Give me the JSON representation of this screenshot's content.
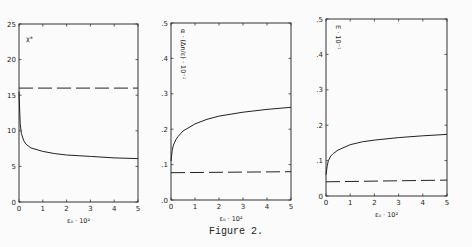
{
  "caption": "Figure 2.",
  "chart_data": [
    {
      "type": "line",
      "title": "",
      "xlabel": "ε₀ · 10²",
      "ylabel": "χ*",
      "xlim": [
        0,
        5
      ],
      "ylim": [
        0,
        25
      ],
      "xticks": [
        "0",
        "1",
        "2",
        "3",
        "4",
        "5"
      ],
      "yticks": [
        "0",
        "5",
        "10",
        "15",
        "20",
        "25"
      ],
      "grid": false,
      "series": [
        {
          "name": "solid",
          "style": "solid",
          "x": [
            0,
            0.05,
            0.1,
            0.2,
            0.3,
            0.5,
            1,
            1.5,
            2,
            3,
            4,
            5
          ],
          "y": [
            15.5,
            11,
            9.6,
            8.6,
            8.1,
            7.6,
            7.1,
            6.8,
            6.6,
            6.4,
            6.2,
            6.1
          ]
        },
        {
          "name": "dashed",
          "style": "dashed",
          "x": [
            0,
            5
          ],
          "y": [
            16,
            16
          ]
        }
      ]
    },
    {
      "type": "line",
      "title": "",
      "xlabel": "ε₀ · 10²",
      "ylabel": "α · (Δn/ε) · 10⁻¹",
      "xlim": [
        0,
        5
      ],
      "ylim": [
        0,
        0.5
      ],
      "xticks": [
        "0",
        "1",
        "2",
        "3",
        "4",
        "5"
      ],
      "yticks": [
        ".0",
        ".1",
        ".2",
        ".3",
        ".4",
        ".5"
      ],
      "grid": false,
      "series": [
        {
          "name": "solid",
          "style": "solid",
          "x": [
            0,
            0.05,
            0.1,
            0.2,
            0.3,
            0.5,
            1,
            1.5,
            2,
            3,
            4,
            5
          ],
          "y": [
            0.11,
            0.14,
            0.155,
            0.17,
            0.18,
            0.195,
            0.215,
            0.228,
            0.237,
            0.248,
            0.256,
            0.262
          ]
        },
        {
          "name": "dashed",
          "style": "dashed",
          "x": [
            0,
            5
          ],
          "y": [
            0.077,
            0.08
          ]
        }
      ]
    },
    {
      "type": "line",
      "title": "",
      "xlabel": "ε₀ · 10²",
      "ylabel": "E · 10⁻¹",
      "xlim": [
        0,
        5
      ],
      "ylim": [
        0,
        0.5
      ],
      "xticks": [
        "0",
        "1",
        "2",
        "3",
        "4",
        "5"
      ],
      "yticks": [
        "0",
        ".1",
        ".2",
        ".3",
        ".4",
        ".5"
      ],
      "grid": false,
      "series": [
        {
          "name": "solid",
          "style": "solid",
          "x": [
            0,
            0.05,
            0.1,
            0.2,
            0.3,
            0.5,
            1,
            1.5,
            2,
            3,
            4,
            5
          ],
          "y": [
            0.06,
            0.085,
            0.1,
            0.113,
            0.12,
            0.13,
            0.145,
            0.153,
            0.158,
            0.165,
            0.17,
            0.174
          ]
        },
        {
          "name": "dashed",
          "style": "dashed",
          "x": [
            0,
            5
          ],
          "y": [
            0.04,
            0.045
          ]
        }
      ]
    }
  ],
  "frames": [
    {
      "left": 19,
      "top": 24,
      "right": 138,
      "bottom": 202
    },
    {
      "left": 171,
      "top": 23,
      "right": 291,
      "bottom": 200
    },
    {
      "left": 326,
      "top": 19,
      "right": 447,
      "bottom": 196
    }
  ]
}
